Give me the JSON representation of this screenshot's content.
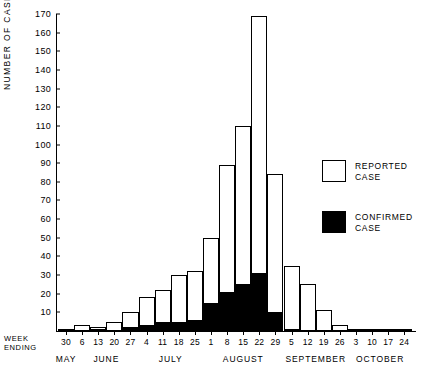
{
  "axis": {
    "y_title": "NUMBER OF CASES",
    "y_ticks": [
      0,
      10,
      20,
      30,
      40,
      50,
      60,
      70,
      80,
      90,
      100,
      110,
      120,
      130,
      140,
      150,
      160,
      170
    ],
    "week_ending_line1": "WEEK",
    "week_ending_line2": "ENDING"
  },
  "legend": {
    "items": [
      {
        "label_line1": "REPORTED",
        "label_line2": "CASE",
        "swatch": "open",
        "color": "#ffffff"
      },
      {
        "label_line1": "CONFIRMED",
        "label_line2": "CASE",
        "swatch": "filled",
        "color": "#000000"
      }
    ]
  },
  "chart_data": {
    "type": "bar",
    "title": "",
    "xlabel": "WEEK ENDING",
    "ylabel": "NUMBER OF CASES",
    "ylim": [
      0,
      170
    ],
    "ytick_step": 10,
    "grid": false,
    "legend_position": "right",
    "stacked": true,
    "categories": [
      "30",
      "6",
      "13",
      "20",
      "27",
      "4",
      "11",
      "18",
      "25",
      "1",
      "8",
      "15",
      "22",
      "29",
      "5",
      "12",
      "19",
      "26",
      "3",
      "10",
      "17",
      "24"
    ],
    "months": [
      {
        "name": "MAY",
        "start_index": 0,
        "end_index": 0
      },
      {
        "name": "JUNE",
        "start_index": 1,
        "end_index": 4
      },
      {
        "name": "JULY",
        "start_index": 5,
        "end_index": 8
      },
      {
        "name": "AUGUST",
        "start_index": 9,
        "end_index": 13
      },
      {
        "name": "SEPTEMBER",
        "start_index": 14,
        "end_index": 17
      },
      {
        "name": "OCTOBER",
        "start_index": 18,
        "end_index": 21
      }
    ],
    "series": [
      {
        "name": "REPORTED CASE",
        "color": "#ffffff",
        "values": [
          1,
          3,
          2,
          5,
          10,
          18,
          22,
          30,
          32,
          50,
          89,
          110,
          169,
          84,
          35,
          25,
          11,
          3,
          1,
          1,
          1,
          1
        ]
      },
      {
        "name": "CONFIRMED CASE",
        "color": "#000000",
        "values": [
          0,
          0,
          1,
          0,
          2,
          3,
          5,
          5,
          6,
          15,
          21,
          25,
          31,
          10,
          1,
          0,
          0,
          0,
          0,
          0,
          0,
          0
        ]
      }
    ]
  }
}
